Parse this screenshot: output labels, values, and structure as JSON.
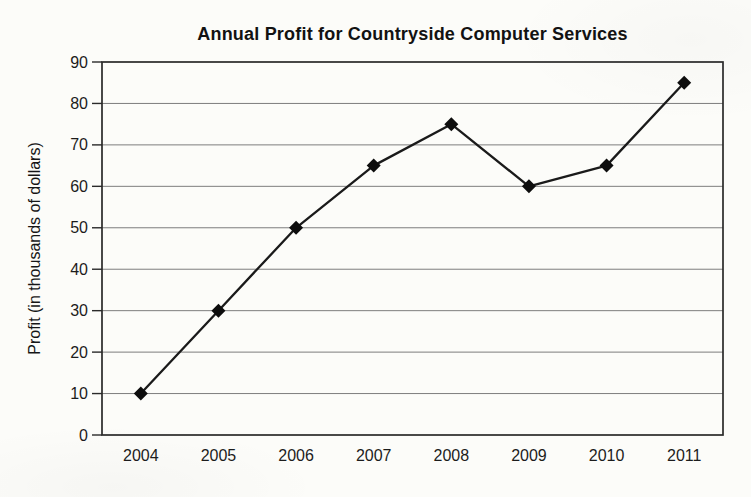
{
  "chart_data": {
    "type": "line",
    "title": "Annual Profit for Countryside Computer Services",
    "xlabel": "",
    "ylabel": "Profit (in thousands of dollars)",
    "categories": [
      "2004",
      "2005",
      "2006",
      "2007",
      "2008",
      "2009",
      "2010",
      "2011"
    ],
    "series": [
      {
        "name": "Profit",
        "values": [
          10,
          30,
          50,
          65,
          75,
          60,
          65,
          85
        ]
      }
    ],
    "ylim": [
      0,
      90
    ],
    "yticks": [
      0,
      10,
      20,
      30,
      40,
      50,
      60,
      70,
      80,
      90
    ],
    "grid": "horizontal",
    "legend": "none",
    "marker": "diamond",
    "frame": "box",
    "colors": {
      "line": "#1a1a1a",
      "marker": "#0d0d0d",
      "grid": "#7d7d7d",
      "axis": "#2a2a2a",
      "text": "#1c1c1c",
      "background": "#fcfcf9"
    }
  }
}
